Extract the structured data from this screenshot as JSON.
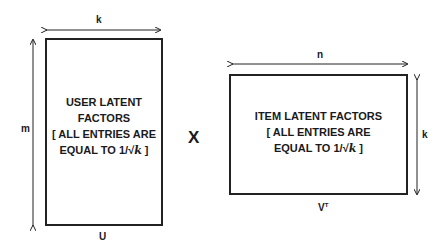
{
  "left_matrix": {
    "name": "U",
    "text_lines": [
      "USER LATENT",
      "FACTORS",
      "[ ALL ENTRIES ARE",
      "EQUAL TO 1/√"
    ],
    "text_var": "k",
    "text_close": " ]",
    "width_label": "k",
    "height_label": "m"
  },
  "operator": "X",
  "right_matrix": {
    "name": "V",
    "superscript": "T",
    "text_lines": [
      "ITEM LATENT FACTORS",
      "[ ALL ENTRIES ARE",
      "EQUAL TO 1/√"
    ],
    "text_var": "k",
    "text_close": " ]",
    "width_label": "n",
    "height_label": "k"
  }
}
